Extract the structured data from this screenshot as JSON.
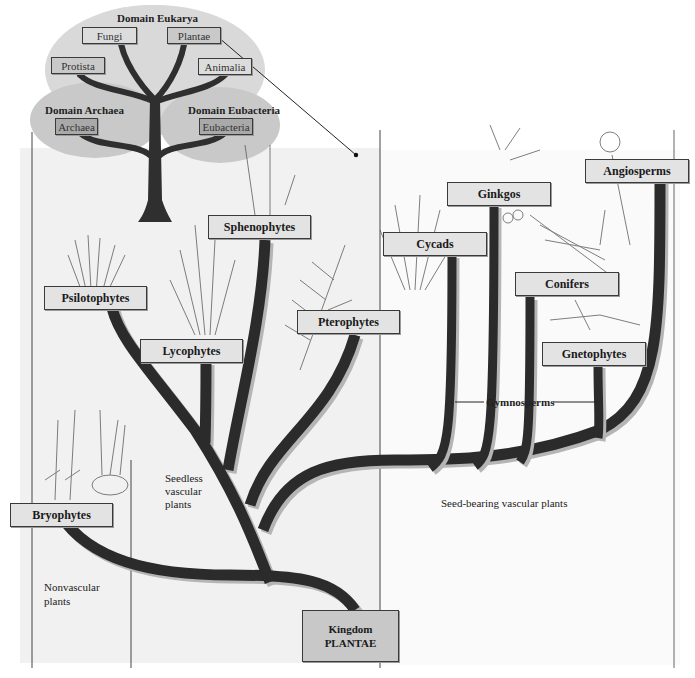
{
  "domains": {
    "eukarya": {
      "title": "Domain Eukarya",
      "kingdoms": [
        "Fungi",
        "Plantae",
        "Protista",
        "Animalia"
      ]
    },
    "archaea": {
      "title": "Domain Archaea",
      "kingdoms": [
        "Archaea"
      ]
    },
    "eubacteria": {
      "title": "Domain Eubacteria",
      "kingdoms": [
        "Eubacteria"
      ]
    }
  },
  "plant_groups": {
    "bryophytes": "Bryophytes",
    "psilotophytes": "Psilotophytes",
    "lycophytes": "Lycophytes",
    "sphenophytes": "Sphenophytes",
    "pterophytes": "Pterophytes",
    "cycads": "Cycads",
    "ginkgos": "Ginkgos",
    "conifers": "Conifers",
    "gnetophytes": "Gnetophytes",
    "angiosperms": "Angiosperms"
  },
  "root": {
    "line1": "Kingdom",
    "line2": "PLANTAE"
  },
  "categories": {
    "nonvascular": [
      "Nonvascular",
      "plants"
    ],
    "seedless": [
      "Seedless",
      "vascular",
      "plants"
    ],
    "seed_bearing": "Seed-bearing vascular plants",
    "gymnosperms": "Gymnosperms"
  },
  "colors": {
    "branch": "#2b2b2b",
    "label_fill": "#e3e3e3",
    "label_dark": "#a9a9a9",
    "panel_shade": "#f1f1f1",
    "tree_cloud": "#d4d4d4"
  }
}
